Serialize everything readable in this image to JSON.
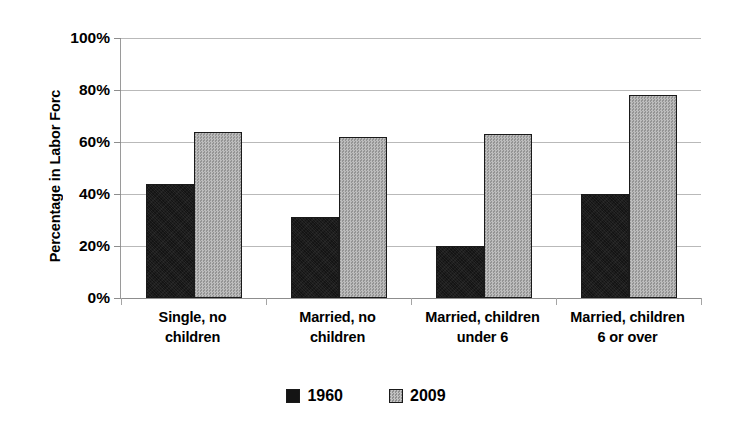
{
  "chart_data": {
    "type": "bar",
    "title": "",
    "xlabel": "",
    "ylabel": "Percentage in Labor Forc",
    "categories": [
      "Single, no children",
      "Married, no children",
      "Married, children under 6",
      "Married, children 6 or over"
    ],
    "category_lines": [
      [
        "Single, no",
        "children"
      ],
      [
        "Married, no",
        "children"
      ],
      [
        "Married, children",
        "under 6"
      ],
      [
        "Married, children",
        "6 or over"
      ]
    ],
    "series": [
      {
        "name": "1960",
        "values": [
          44,
          31,
          20,
          40
        ],
        "color": "#141414"
      },
      {
        "name": "2009",
        "values": [
          64,
          62,
          63,
          78
        ],
        "color": "#a9a9a9"
      }
    ],
    "ylim": [
      0,
      100
    ],
    "ytick_values": [
      0,
      20,
      40,
      60,
      80,
      100
    ],
    "ytick_labels": [
      "0%",
      "20%",
      "40%",
      "60%",
      "80%",
      "100%"
    ],
    "grid": true,
    "legend_position": "bottom"
  }
}
